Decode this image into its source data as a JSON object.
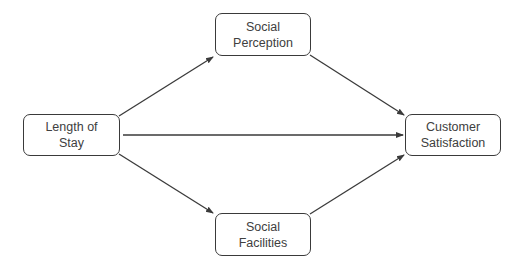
{
  "diagram": {
    "type": "path-model",
    "colors": {
      "stroke": "#3a3a3a",
      "text": "#404040",
      "background": "#ffffff"
    },
    "nodes": {
      "length_of_stay": {
        "lines": [
          "Length of",
          "Stay"
        ]
      },
      "social_perception": {
        "lines": [
          "Social",
          "Perception"
        ]
      },
      "customer_satisfaction": {
        "lines": [
          "Customer",
          "Satisfaction"
        ]
      },
      "social_facilities": {
        "lines": [
          "Social",
          "Facilities"
        ]
      }
    },
    "edges": [
      {
        "from": "Length of Stay",
        "to": "Social Perception"
      },
      {
        "from": "Length of Stay",
        "to": "Customer Satisfaction"
      },
      {
        "from": "Length of Stay",
        "to": "Social Facilities"
      },
      {
        "from": "Social Perception",
        "to": "Customer Satisfaction"
      },
      {
        "from": "Social Facilities",
        "to": "Customer Satisfaction"
      }
    ]
  }
}
